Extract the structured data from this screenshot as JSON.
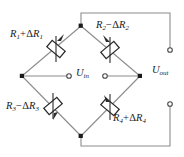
{
  "figure": {
    "background_color": "#ffffff",
    "line_color": "#8c8c8c",
    "node_color": "#1a1a1a",
    "text_color": "#1a1a1a"
  },
  "labels": {
    "r1": {
      "base": "R",
      "base_sub": "1",
      "op": "+",
      "delta": "Δ",
      "delta_base": "R",
      "delta_sub": "1",
      "full": "R1+ΔR1"
    },
    "r2": {
      "base": "R",
      "base_sub": "2",
      "op": "−",
      "delta": "Δ",
      "delta_base": "R",
      "delta_sub": "2",
      "full": "R2−ΔR2"
    },
    "r3": {
      "base": "R",
      "base_sub": "3",
      "op": "−",
      "delta": "Δ",
      "delta_base": "R",
      "delta_sub": "3",
      "full": "R3−ΔR3"
    },
    "r4": {
      "base": "R",
      "base_sub": "4",
      "op": "+",
      "delta": "Δ",
      "delta_base": "R",
      "delta_sub": "4",
      "full": "R4+ΔR4"
    },
    "u_in": {
      "base": "U",
      "sub": "in",
      "full": "Uin"
    },
    "u_out": {
      "base": "U",
      "sub": "out",
      "full": "Uout"
    }
  },
  "nodes": {
    "top": {
      "x": 81,
      "y": 26
    },
    "left": {
      "x": 22,
      "y": 76
    },
    "right": {
      "x": 140,
      "y": 76
    },
    "bottom": {
      "x": 81,
      "y": 136
    }
  },
  "terminals": {
    "u_in_left": {
      "x": 70,
      "y": 76,
      "type": "open-circle"
    },
    "u_in_right": {
      "x": 104,
      "y": 76,
      "type": "open-circle"
    },
    "u_out_top": {
      "x": 170,
      "y": 50,
      "type": "open-circle"
    },
    "u_out_bot": {
      "x": 170,
      "y": 104,
      "type": "open-circle"
    }
  },
  "resistors": [
    {
      "name": "R1",
      "branch": "top-left",
      "symbol": "variable-resistor"
    },
    {
      "name": "R2",
      "branch": "top-right",
      "symbol": "variable-resistor"
    },
    {
      "name": "R3",
      "branch": "bottom-left",
      "symbol": "variable-resistor"
    },
    {
      "name": "R4",
      "branch": "bottom-right",
      "symbol": "variable-resistor"
    }
  ]
}
